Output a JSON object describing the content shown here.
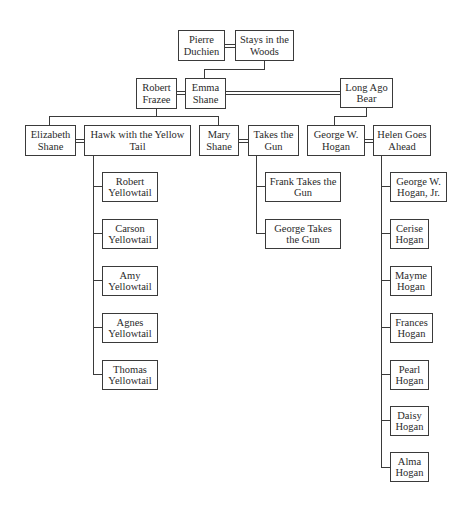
{
  "generation_1": {
    "pierre_duchien": "Pierre Duchien",
    "stays_in_the_woods": "Stays in the Woods"
  },
  "generation_2": {
    "robert_frazee": "Robert Frazee",
    "emma_shane": "Emma Shane",
    "long_ago_bear": "Long Ago Bear"
  },
  "generation_3": {
    "elizabeth_shane": "Elizabeth Shane",
    "hawk_with_the_yellow_tail": "Hawk with the Yellow Tail",
    "mary_shane": "Mary Shane",
    "takes_the_gun": "Takes the Gun",
    "george_w_hogan": "George W. Hogan",
    "helen_goes_ahead": "Helen Goes Ahead"
  },
  "yellowtail_children": [
    "Robert Yellowtail",
    "Carson Yellowtail",
    "Amy Yellowtail",
    "Agnes Yellowtail",
    "Thomas Yellowtail"
  ],
  "takes_the_gun_children": [
    "Frank Takes the Gun",
    "George Takes the Gun"
  ],
  "hogan_children": [
    "George W. Hogan, Jr.",
    "Cerise Hogan",
    "Mayme Hogan",
    "Frances Hogan",
    "Pearl Hogan",
    "Daisy Hogan",
    "Alma Hogan"
  ]
}
